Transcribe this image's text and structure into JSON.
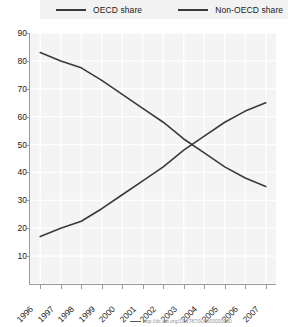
{
  "legend": {
    "position": "top",
    "entries": [
      {
        "label": "OECD share",
        "color": "#3a3a3a"
      },
      {
        "label": "Non-OECD share",
        "color": "#3a3a3a"
      }
    ]
  },
  "caption": {
    "text": "http://dx.doi.org/10.1787/000000000000"
  },
  "chart_data": {
    "type": "line",
    "title": "",
    "xlabel": "",
    "ylabel": "",
    "grid": true,
    "ylim": [
      0,
      90
    ],
    "yticks": [
      0,
      10,
      20,
      30,
      40,
      50,
      60,
      70,
      80,
      90
    ],
    "ytick_labels": [
      "0",
      "10",
      "20",
      "30",
      "40",
      "50",
      "60",
      "70",
      "80",
      "90"
    ],
    "categories": [
      "1996",
      "1997",
      "1998",
      "1999",
      "2000",
      "2001",
      "2002",
      "2003",
      "2004",
      "2005",
      "2006",
      "2007"
    ],
    "x": [
      "1996",
      "1997",
      "1998",
      "1999",
      "2000",
      "2001",
      "2002",
      "2003",
      "2004",
      "2005",
      "2006",
      "2007"
    ],
    "series": [
      {
        "name": "OECD share",
        "color": "#3a3a3a",
        "values": [
          83,
          80,
          77.5,
          73,
          68,
          63,
          58,
          52,
          47,
          42,
          38,
          35
        ]
      },
      {
        "name": "Non-OECD share",
        "color": "#3a3a3a",
        "values": [
          17,
          20,
          22.5,
          27,
          32,
          37,
          42,
          48,
          53,
          58,
          62,
          65
        ]
      }
    ],
    "annotations": [],
    "crossover": {
      "approx_year": "2003",
      "approx_value": 50
    }
  }
}
